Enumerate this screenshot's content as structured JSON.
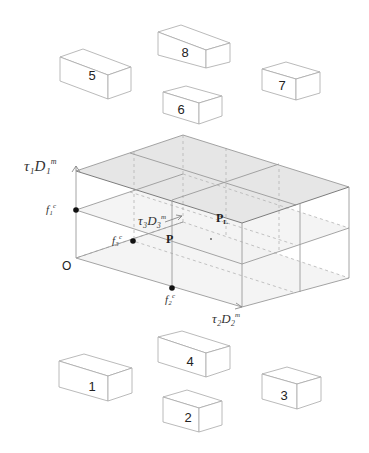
{
  "diagram": {
    "title": "",
    "origin_label": "O",
    "axes": {
      "vertical": {
        "label_main": "τ₁D₁",
        "label_sup": "m"
      },
      "depth": {
        "label_main": "τ₃D₃",
        "label_sup": "m"
      },
      "horizontal": {
        "label_main": "τ₂D₂",
        "label_sup": "m"
      }
    },
    "points": {
      "f1": {
        "label": "f₁",
        "sup": "c"
      },
      "f2": {
        "label": "f₂",
        "sup": "c"
      },
      "f3": {
        "label": "f₃",
        "sup": "c"
      },
      "P": {
        "label": "P"
      },
      "PL": {
        "label": "P",
        "sub": "L"
      }
    },
    "blocks": [
      {
        "id": "block-5",
        "label": "5"
      },
      {
        "id": "block-8",
        "label": "8"
      },
      {
        "id": "block-6",
        "label": "6"
      },
      {
        "id": "block-7",
        "label": "7"
      },
      {
        "id": "block-1",
        "label": "1"
      },
      {
        "id": "block-4",
        "label": "4"
      },
      {
        "id": "block-2",
        "label": "2"
      },
      {
        "id": "block-3",
        "label": "3"
      }
    ],
    "colors": {
      "shade": "#e6e6e6",
      "edge": "#9a9a9a",
      "point": "#111111"
    }
  }
}
